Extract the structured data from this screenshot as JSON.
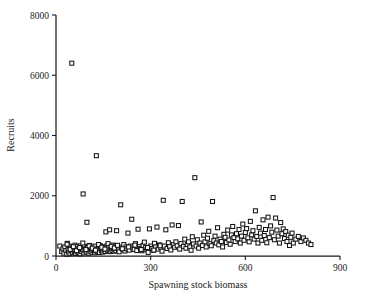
{
  "chart_data": {
    "type": "scatter",
    "title": "",
    "xlabel": "Spawning stock biomass",
    "ylabel": "Recruits",
    "xlim": [
      0,
      900
    ],
    "ylim": [
      0,
      8000
    ],
    "xticks": [
      0,
      300,
      600,
      900
    ],
    "yticks": [
      0,
      2000,
      4000,
      6000,
      8000
    ],
    "xtick_labels": [
      "0",
      "300",
      "600",
      "900"
    ],
    "ytick_labels": [
      "0",
      "2000",
      "4000",
      "6000",
      "8000"
    ],
    "grid": false,
    "legend": null,
    "marker": "open-square",
    "marker_color": "#141414",
    "marker_fill": "#ffffff",
    "n_points": 251,
    "points": [
      [
        12,
        330
      ],
      [
        18,
        150
      ],
      [
        22,
        240
      ],
      [
        25,
        95
      ],
      [
        28,
        300
      ],
      [
        31,
        180
      ],
      [
        34,
        60
      ],
      [
        36,
        420
      ],
      [
        38,
        210
      ],
      [
        40,
        130
      ],
      [
        42,
        330
      ],
      [
        44,
        75
      ],
      [
        46,
        260
      ],
      [
        48,
        170
      ],
      [
        50,
        6400
      ],
      [
        52,
        110
      ],
      [
        54,
        290
      ],
      [
        56,
        200
      ],
      [
        58,
        140
      ],
      [
        60,
        360
      ],
      [
        62,
        85
      ],
      [
        64,
        230
      ],
      [
        66,
        160
      ],
      [
        68,
        310
      ],
      [
        70,
        120
      ],
      [
        72,
        250
      ],
      [
        74,
        190
      ],
      [
        76,
        70
      ],
      [
        78,
        340
      ],
      [
        80,
        145
      ],
      [
        82,
        270
      ],
      [
        84,
        205
      ],
      [
        86,
        2060
      ],
      [
        88,
        100
      ],
      [
        90,
        315
      ],
      [
        92,
        175
      ],
      [
        94,
        240
      ],
      [
        96,
        135
      ],
      [
        98,
        1120
      ],
      [
        100,
        285
      ],
      [
        102,
        195
      ],
      [
        104,
        90
      ],
      [
        106,
        350
      ],
      [
        108,
        155
      ],
      [
        110,
        265
      ],
      [
        112,
        215
      ],
      [
        114,
        125
      ],
      [
        116,
        300
      ],
      [
        118,
        185
      ],
      [
        120,
        245
      ],
      [
        122,
        105
      ],
      [
        124,
        330
      ],
      [
        126,
        165
      ],
      [
        128,
        3330
      ],
      [
        130,
        225
      ],
      [
        132,
        140
      ],
      [
        134,
        290
      ],
      [
        136,
        200
      ],
      [
        138,
        115
      ],
      [
        140,
        345
      ],
      [
        142,
        255
      ],
      [
        144,
        175
      ],
      [
        146,
        235
      ],
      [
        148,
        130
      ],
      [
        150,
        305
      ],
      [
        152,
        190
      ],
      [
        154,
        260
      ],
      [
        156,
        150
      ],
      [
        158,
        800
      ],
      [
        160,
        220
      ],
      [
        162,
        340
      ],
      [
        164,
        170
      ],
      [
        166,
        280
      ],
      [
        168,
        205
      ],
      [
        170,
        870
      ],
      [
        172,
        145
      ],
      [
        174,
        315
      ],
      [
        176,
        240
      ],
      [
        178,
        185
      ],
      [
        180,
        360
      ],
      [
        182,
        255
      ],
      [
        184,
        160
      ],
      [
        186,
        230
      ],
      [
        188,
        295
      ],
      [
        190,
        175
      ],
      [
        192,
        840
      ],
      [
        194,
        250
      ],
      [
        196,
        320
      ],
      [
        198,
        200
      ],
      [
        200,
        140
      ],
      [
        205,
        1700
      ],
      [
        208,
        270
      ],
      [
        212,
        225
      ],
      [
        215,
        380
      ],
      [
        218,
        165
      ],
      [
        222,
        300
      ],
      [
        225,
        240
      ],
      [
        228,
        760
      ],
      [
        232,
        195
      ],
      [
        236,
        330
      ],
      [
        240,
        1220
      ],
      [
        244,
        265
      ],
      [
        248,
        215
      ],
      [
        252,
        410
      ],
      [
        256,
        180
      ],
      [
        260,
        890
      ],
      [
        264,
        310
      ],
      [
        268,
        245
      ],
      [
        272,
        175
      ],
      [
        276,
        350
      ],
      [
        280,
        460
      ],
      [
        284,
        280
      ],
      [
        288,
        205
      ],
      [
        292,
        120
      ],
      [
        296,
        900
      ],
      [
        300,
        330
      ],
      [
        304,
        250
      ],
      [
        308,
        190
      ],
      [
        312,
        420
      ],
      [
        316,
        300
      ],
      [
        320,
        960
      ],
      [
        324,
        230
      ],
      [
        328,
        370
      ],
      [
        332,
        285
      ],
      [
        336,
        160
      ],
      [
        340,
        1850
      ],
      [
        344,
        330
      ],
      [
        348,
        870
      ],
      [
        352,
        250
      ],
      [
        356,
        440
      ],
      [
        360,
        310
      ],
      [
        364,
        200
      ],
      [
        368,
        1030
      ],
      [
        372,
        380
      ],
      [
        376,
        290
      ],
      [
        380,
        470
      ],
      [
        384,
        340
      ],
      [
        388,
        1010
      ],
      [
        392,
        230
      ],
      [
        396,
        410
      ],
      [
        400,
        1810
      ],
      [
        404,
        320
      ],
      [
        408,
        560
      ],
      [
        412,
        260
      ],
      [
        416,
        380
      ],
      [
        420,
        470
      ],
      [
        424,
        300
      ],
      [
        428,
        190
      ],
      [
        432,
        640
      ],
      [
        436,
        400
      ],
      [
        440,
        2600
      ],
      [
        444,
        330
      ],
      [
        448,
        540
      ],
      [
        452,
        260
      ],
      [
        456,
        430
      ],
      [
        460,
        1130
      ],
      [
        464,
        350
      ],
      [
        468,
        690
      ],
      [
        472,
        470
      ],
      [
        476,
        300
      ],
      [
        480,
        590
      ],
      [
        484,
        820
      ],
      [
        488,
        410
      ],
      [
        492,
        340
      ],
      [
        496,
        1810
      ],
      [
        500,
        510
      ],
      [
        504,
        660
      ],
      [
        508,
        430
      ],
      [
        512,
        940
      ],
      [
        516,
        370
      ],
      [
        520,
        560
      ],
      [
        524,
        480
      ],
      [
        528,
        300
      ],
      [
        532,
        720
      ],
      [
        536,
        620
      ],
      [
        540,
        450
      ],
      [
        544,
        860
      ],
      [
        548,
        530
      ],
      [
        552,
        390
      ],
      [
        556,
        700
      ],
      [
        560,
        980
      ],
      [
        564,
        610
      ],
      [
        568,
        480
      ],
      [
        572,
        740
      ],
      [
        576,
        570
      ],
      [
        580,
        880
      ],
      [
        584,
        430
      ],
      [
        588,
        660
      ],
      [
        592,
        1060
      ],
      [
        596,
        520
      ],
      [
        600,
        780
      ],
      [
        604,
        910
      ],
      [
        608,
        600
      ],
      [
        612,
        470
      ],
      [
        616,
        1150
      ],
      [
        620,
        700
      ],
      [
        624,
        840
      ],
      [
        628,
        560
      ],
      [
        632,
        1500
      ],
      [
        636,
        650
      ],
      [
        640,
        430
      ],
      [
        644,
        950
      ],
      [
        648,
        760
      ],
      [
        652,
        520
      ],
      [
        656,
        1200
      ],
      [
        660,
        680
      ],
      [
        664,
        880
      ],
      [
        668,
        440
      ],
      [
        672,
        1290
      ],
      [
        676,
        610
      ],
      [
        680,
        1000
      ],
      [
        684,
        790
      ],
      [
        688,
        1940
      ],
      [
        692,
        540
      ],
      [
        696,
        1260
      ],
      [
        700,
        860
      ],
      [
        704,
        660
      ],
      [
        708,
        430
      ],
      [
        712,
        1110
      ],
      [
        716,
        740
      ],
      [
        720,
        900
      ],
      [
        724,
        580
      ],
      [
        728,
        810
      ],
      [
        732,
        480
      ],
      [
        736,
        690
      ],
      [
        740,
        350
      ],
      [
        744,
        620
      ],
      [
        748,
        760
      ],
      [
        752,
        430
      ],
      [
        760,
        560
      ],
      [
        768,
        650
      ],
      [
        776,
        480
      ],
      [
        784,
        600
      ],
      [
        792,
        520
      ],
      [
        800,
        430
      ],
      [
        808,
        380
      ],
      [
        35,
        390
      ],
      [
        45,
        220
      ],
      [
        55,
        310
      ],
      [
        65,
        180
      ],
      [
        75,
        280
      ],
      [
        85,
        430
      ],
      [
        95,
        215
      ],
      [
        105,
        335
      ],
      [
        115,
        260
      ],
      [
        125,
        195
      ],
      [
        135,
        380
      ],
      [
        145,
        290
      ],
      [
        155,
        230
      ],
      [
        165,
        410
      ],
      [
        175,
        320
      ],
      [
        185,
        265
      ],
      [
        195,
        355
      ],
      [
        210,
        240
      ],
      [
        230,
        300
      ],
      [
        250,
        360
      ],
      [
        270,
        215
      ],
      [
        290,
        280
      ],
      [
        310,
        195
      ],
      [
        330,
        340
      ]
    ]
  }
}
